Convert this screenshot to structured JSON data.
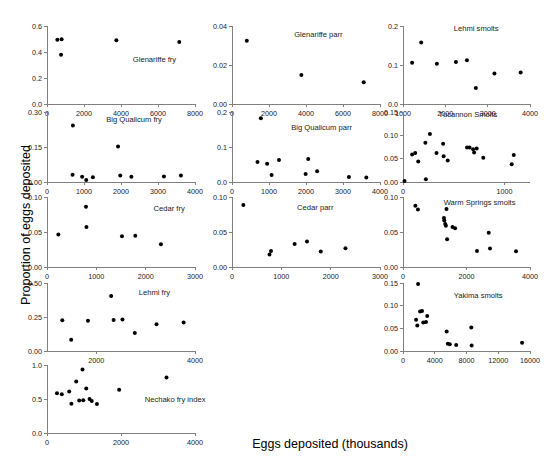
{
  "figure": {
    "xlabel": "Eggs deposited (thousands)",
    "ylabel": "Proportion of eggs deposited",
    "point_color": "#000000",
    "axis_color": "#808080"
  },
  "chart_data": [
    {
      "type": "scatter",
      "title": "Glenariffe fry",
      "xlabel": "",
      "ylabel": "",
      "xlim": [
        0,
        8000
      ],
      "ylim": [
        0.0,
        0.6
      ],
      "xticks": [
        0,
        2000,
        4000,
        6000,
        8000
      ],
      "xticklabels": [
        "0",
        "2000",
        "4000",
        "6000",
        "8000"
      ],
      "yticks": [
        0.0,
        0.2,
        0.4,
        0.6
      ],
      "yticklabels": [
        "0.0",
        "0.2",
        "0.4",
        "0.6"
      ],
      "grid": false,
      "legend": "none",
      "points": [
        {
          "x": 560,
          "y": 0.495
        },
        {
          "x": 790,
          "y": 0.498
        },
        {
          "x": 760,
          "y": 0.378
        },
        {
          "x": 3750,
          "y": 0.49
        },
        {
          "x": 7150,
          "y": 0.477
        }
      ]
    },
    {
      "type": "scatter",
      "title": "Glenariffe parr",
      "xlabel": "",
      "ylabel": "",
      "xlim": [
        0,
        8000
      ],
      "ylim": [
        0.0,
        0.04
      ],
      "xticks": [
        0,
        2000,
        4000,
        6000,
        8000
      ],
      "xticklabels": [
        "0",
        "2000",
        "4000",
        "6000",
        "8000"
      ],
      "yticks": [
        0.0,
        0.02,
        0.04
      ],
      "yticklabels": [
        "0.00",
        "0.02",
        "0.04"
      ],
      "grid": false,
      "legend": "none",
      "points": [
        {
          "x": 800,
          "y": 0.0325
        },
        {
          "x": 3750,
          "y": 0.0149
        },
        {
          "x": 7120,
          "y": 0.0112
        }
      ]
    },
    {
      "type": "scatter",
      "title": "Lehmi smolts",
      "xlabel": "",
      "ylabel": "",
      "xlim": [
        1000,
        4000
      ],
      "ylim": [
        0.0,
        0.2
      ],
      "xticks": [
        1000,
        2000,
        3000,
        4000
      ],
      "xticklabels": [
        "1000",
        "2000",
        "3000",
        "4000"
      ],
      "yticks": [
        0.0,
        0.1,
        0.2
      ],
      "yticklabels": [
        "0.0",
        "0.1",
        "0.2"
      ],
      "grid": false,
      "legend": "none",
      "points": [
        {
          "x": 1215,
          "y": 0.106
        },
        {
          "x": 1430,
          "y": 0.158
        },
        {
          "x": 1800,
          "y": 0.103
        },
        {
          "x": 2250,
          "y": 0.108
        },
        {
          "x": 2510,
          "y": 0.112
        },
        {
          "x": 2720,
          "y": 0.041
        },
        {
          "x": 3160,
          "y": 0.078
        },
        {
          "x": 3780,
          "y": 0.081
        }
      ]
    },
    {
      "type": "scatter",
      "title": "Big Qualicum fry",
      "xlabel": "",
      "ylabel": "",
      "xlim": [
        0,
        4000
      ],
      "ylim": [
        0.0,
        0.3
      ],
      "xticks": [
        0,
        1000,
        2000,
        3000,
        4000
      ],
      "xticklabels": [
        "0",
        "1000",
        "2000",
        "3000",
        "4000"
      ],
      "yticks": [
        0.0,
        0.15,
        0.3
      ],
      "yticklabels": [
        "0.00",
        "0.15",
        "0.30"
      ],
      "grid": false,
      "legend": "none",
      "points": [
        {
          "x": 700,
          "y": 0.242
        },
        {
          "x": 690,
          "y": 0.031
        },
        {
          "x": 950,
          "y": 0.022
        },
        {
          "x": 1060,
          "y": 0.009
        },
        {
          "x": 1240,
          "y": 0.02
        },
        {
          "x": 1920,
          "y": 0.152
        },
        {
          "x": 1980,
          "y": 0.028
        },
        {
          "x": 2280,
          "y": 0.022
        },
        {
          "x": 3160,
          "y": 0.024
        },
        {
          "x": 3620,
          "y": 0.028
        }
      ]
    },
    {
      "type": "scatter",
      "title": "Big Qualicum parr",
      "xlabel": "",
      "ylabel": "",
      "xlim": [
        0,
        4000
      ],
      "ylim": [
        0.0,
        0.2
      ],
      "xticks": [
        0,
        1000,
        2000,
        3000,
        4000
      ],
      "xticklabels": [
        "0",
        "1000",
        "2000",
        "3000",
        "4000"
      ],
      "yticks": [
        0.0,
        0.1,
        0.2
      ],
      "yticklabels": [
        "0.0",
        "0.1",
        "0.2"
      ],
      "grid": false,
      "legend": "none",
      "points": [
        {
          "x": 780,
          "y": 0.182
        },
        {
          "x": 690,
          "y": 0.057
        },
        {
          "x": 950,
          "y": 0.052
        },
        {
          "x": 1070,
          "y": 0.02
        },
        {
          "x": 1270,
          "y": 0.063
        },
        {
          "x": 1990,
          "y": 0.023
        },
        {
          "x": 2060,
          "y": 0.066
        },
        {
          "x": 2300,
          "y": 0.031
        },
        {
          "x": 3160,
          "y": 0.014
        },
        {
          "x": 3630,
          "y": 0.013
        }
      ]
    },
    {
      "type": "scatter",
      "title": "Tucannon Smolts",
      "xlabel": "",
      "ylabel": "",
      "xlim": [
        0,
        1250
      ],
      "ylim": [
        0.0,
        0.15
      ],
      "xticks": [
        0,
        1000
      ],
      "xticklabels": [
        "0",
        "1000"
      ],
      "yticks": [
        0.0,
        0.05,
        0.1,
        0.15
      ],
      "yticklabels": [
        "0.00",
        "0.05",
        "0.10",
        "0.15"
      ],
      "grid": false,
      "legend": "none",
      "points": [
        {
          "x": 15,
          "y": 0.002
        },
        {
          "x": 90,
          "y": 0.059
        },
        {
          "x": 120,
          "y": 0.062
        },
        {
          "x": 150,
          "y": 0.044
        },
        {
          "x": 220,
          "y": 0.084
        },
        {
          "x": 225,
          "y": 0.006
        },
        {
          "x": 265,
          "y": 0.103
        },
        {
          "x": 330,
          "y": 0.062
        },
        {
          "x": 395,
          "y": 0.082
        },
        {
          "x": 400,
          "y": 0.055
        },
        {
          "x": 440,
          "y": 0.046
        },
        {
          "x": 630,
          "y": 0.074
        },
        {
          "x": 655,
          "y": 0.074
        },
        {
          "x": 690,
          "y": 0.07
        },
        {
          "x": 700,
          "y": 0.063
        },
        {
          "x": 725,
          "y": 0.072
        },
        {
          "x": 790,
          "y": 0.052
        },
        {
          "x": 1070,
          "y": 0.038
        },
        {
          "x": 1090,
          "y": 0.058
        }
      ]
    },
    {
      "type": "scatter",
      "title": "Cedar fry",
      "xlabel": "",
      "ylabel": "",
      "xlim": [
        0,
        3000
      ],
      "ylim": [
        0.0,
        0.1
      ],
      "xticks": [
        0,
        1000,
        2000,
        3000
      ],
      "xticklabels": [
        "0",
        "1000",
        "2000",
        "3000"
      ],
      "yticks": [
        0.0,
        0.05,
        0.1
      ],
      "yticklabels": [
        "0.00",
        "0.05",
        "0.10"
      ],
      "grid": false,
      "legend": "none",
      "points": [
        {
          "x": 230,
          "y": 0.0465
        },
        {
          "x": 790,
          "y": 0.0862
        },
        {
          "x": 800,
          "y": 0.0573
        },
        {
          "x": 1520,
          "y": 0.044
        },
        {
          "x": 1790,
          "y": 0.0445
        },
        {
          "x": 2310,
          "y": 0.0325
        }
      ]
    },
    {
      "type": "scatter",
      "title": "Cedar parr",
      "xlabel": "",
      "ylabel": "",
      "xlim": [
        0,
        3000
      ],
      "ylim": [
        0.0,
        0.1
      ],
      "xticks": [
        0,
        1000,
        2000,
        3000
      ],
      "xticklabels": [
        "0",
        "1000",
        "2000",
        "3000"
      ],
      "yticks": [
        0.0,
        0.05,
        0.1
      ],
      "yticklabels": [
        "0.00",
        "0.05",
        "0.10"
      ],
      "grid": false,
      "legend": "none",
      "points": [
        {
          "x": 230,
          "y": 0.0885
        },
        {
          "x": 760,
          "y": 0.0178
        },
        {
          "x": 790,
          "y": 0.0228
        },
        {
          "x": 1270,
          "y": 0.033
        },
        {
          "x": 1520,
          "y": 0.0365
        },
        {
          "x": 1800,
          "y": 0.0222
        },
        {
          "x": 2300,
          "y": 0.0268
        }
      ]
    },
    {
      "type": "scatter",
      "title": "Warm Springs smolts",
      "xlabel": "",
      "ylabel": "",
      "xlim": [
        0,
        4000
      ],
      "ylim": [
        0.0,
        0.1
      ],
      "xticks": [
        0,
        2000,
        4000
      ],
      "xticklabels": [
        "0",
        "2000",
        "4000"
      ],
      "yticks": [
        0.0,
        0.05,
        0.1
      ],
      "yticklabels": [
        "0.00",
        "0.05",
        "0.10"
      ],
      "grid": false,
      "legend": "none",
      "points": [
        {
          "x": 390,
          "y": 0.0875
        },
        {
          "x": 470,
          "y": 0.082
        },
        {
          "x": 1290,
          "y": 0.07
        },
        {
          "x": 1300,
          "y": 0.0665
        },
        {
          "x": 1330,
          "y": 0.0615
        },
        {
          "x": 1350,
          "y": 0.059
        },
        {
          "x": 1370,
          "y": 0.083
        },
        {
          "x": 1390,
          "y": 0.0395
        },
        {
          "x": 1560,
          "y": 0.057
        },
        {
          "x": 1640,
          "y": 0.0555
        },
        {
          "x": 2330,
          "y": 0.023
        },
        {
          "x": 2700,
          "y": 0.049
        },
        {
          "x": 2740,
          "y": 0.0265
        },
        {
          "x": 3560,
          "y": 0.0225
        }
      ]
    },
    {
      "type": "scatter",
      "title": "Lehmi fry",
      "xlabel": "",
      "ylabel": "",
      "xlim": [
        1000,
        4000
      ],
      "ylim": [
        0.0,
        0.5
      ],
      "xticks": [
        2000,
        4000
      ],
      "xticklabels": [
        "2000",
        "4000"
      ],
      "yticks": [
        0.0,
        0.25,
        0.5
      ],
      "yticklabels": [
        "0.00",
        "0.25",
        "0.50"
      ],
      "grid": false,
      "legend": "none",
      "points": [
        {
          "x": 1310,
          "y": 0.226
        },
        {
          "x": 1490,
          "y": 0.082
        },
        {
          "x": 1830,
          "y": 0.223
        },
        {
          "x": 2300,
          "y": 0.405
        },
        {
          "x": 2350,
          "y": 0.228
        },
        {
          "x": 2530,
          "y": 0.232
        },
        {
          "x": 2780,
          "y": 0.133
        },
        {
          "x": 3220,
          "y": 0.197
        },
        {
          "x": 3770,
          "y": 0.21
        }
      ]
    },
    {
      "type": "scatter",
      "title": "Yakima smolts",
      "xlabel": "",
      "ylabel": "",
      "xlim": [
        0,
        16000
      ],
      "ylim": [
        0.0,
        0.15
      ],
      "xticks": [
        0,
        4000,
        8000,
        12000,
        16000
      ],
      "xticklabels": [
        "0",
        "4000",
        "8000",
        "12000",
        "16000"
      ],
      "yticks": [
        0.0,
        0.05,
        0.1,
        0.15
      ],
      "yticklabels": [
        "0.00",
        "0.05",
        "0.10",
        "0.15"
      ],
      "grid": false,
      "legend": "none",
      "points": [
        {
          "x": 1900,
          "y": 0.148
        },
        {
          "x": 1650,
          "y": 0.069
        },
        {
          "x": 1800,
          "y": 0.056
        },
        {
          "x": 2150,
          "y": 0.087
        },
        {
          "x": 2400,
          "y": 0.088
        },
        {
          "x": 2550,
          "y": 0.063
        },
        {
          "x": 2900,
          "y": 0.064
        },
        {
          "x": 3050,
          "y": 0.077
        },
        {
          "x": 5500,
          "y": 0.043
        },
        {
          "x": 5650,
          "y": 0.016
        },
        {
          "x": 5900,
          "y": 0.015
        },
        {
          "x": 6700,
          "y": 0.013
        },
        {
          "x": 8600,
          "y": 0.052
        },
        {
          "x": 8650,
          "y": 0.012
        },
        {
          "x": 15000,
          "y": 0.018
        }
      ]
    },
    {
      "type": "scatter",
      "title": "Nechako fry index",
      "xlabel": "",
      "ylabel": "",
      "xlim": [
        0,
        4000
      ],
      "ylim": [
        0.0,
        1.0
      ],
      "xticks": [
        0,
        2000,
        4000
      ],
      "xticklabels": [
        "0",
        "2000",
        "4000"
      ],
      "yticks": [
        0.0,
        0.5,
        1.0
      ],
      "yticklabels": [
        "0.0",
        "0.5",
        "1.0"
      ],
      "grid": false,
      "legend": "none",
      "points": [
        {
          "x": 270,
          "y": 0.585
        },
        {
          "x": 400,
          "y": 0.57
        },
        {
          "x": 600,
          "y": 0.61
        },
        {
          "x": 660,
          "y": 0.43
        },
        {
          "x": 790,
          "y": 0.757
        },
        {
          "x": 870,
          "y": 0.478
        },
        {
          "x": 960,
          "y": 0.935
        },
        {
          "x": 980,
          "y": 0.48
        },
        {
          "x": 1060,
          "y": 0.655
        },
        {
          "x": 1150,
          "y": 0.5
        },
        {
          "x": 1210,
          "y": 0.472
        },
        {
          "x": 1350,
          "y": 0.425
        },
        {
          "x": 1950,
          "y": 0.635
        },
        {
          "x": 3230,
          "y": 0.815
        }
      ]
    }
  ]
}
